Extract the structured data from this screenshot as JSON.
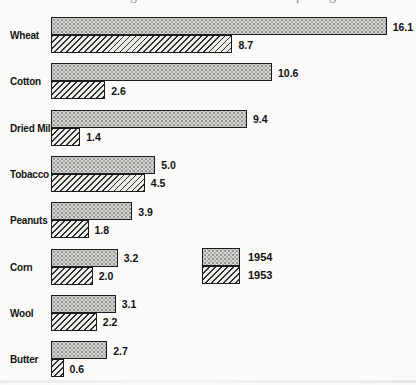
{
  "clipped_title": {
    "fragments": [
      {
        "glyph": "g",
        "x": 130
      },
      {
        "glyph": "p",
        "x": 296
      },
      {
        "glyph": "g",
        "x": 329
      }
    ]
  },
  "chart_data": {
    "type": "bar",
    "orientation": "horizontal",
    "title": "",
    "categories": [
      "Wheat",
      "Cotton",
      "Dried Milk",
      "Tobacco",
      "Peanuts",
      "Corn",
      "Wool",
      "Butter"
    ],
    "series": [
      {
        "name": "1954",
        "pattern": "stipple",
        "values": [
          16.1,
          10.6,
          9.4,
          5.0,
          3.9,
          3.2,
          3.1,
          2.7
        ]
      },
      {
        "name": "1953",
        "pattern": "hatch",
        "values": [
          8.7,
          2.6,
          1.4,
          4.5,
          1.8,
          2.0,
          2.2,
          0.6
        ]
      }
    ],
    "value_labels_shown": true,
    "value_format": "one-decimal",
    "xlim": [
      0,
      16.1
    ],
    "grid": false,
    "legend_position": "middle-right",
    "colors": {
      "bar_fill": "#d7d6d3",
      "bar_speckle": "#8f8f8f",
      "hatch_line": "#303030",
      "hatch_bg": "#ededea",
      "border": "#1b1b1b",
      "text": "#111111",
      "background": "#fbfaf8"
    }
  },
  "legend": {
    "items": [
      {
        "label": "1954",
        "pattern": "stipple"
      },
      {
        "label": "1953",
        "pattern": "hatch"
      }
    ]
  }
}
